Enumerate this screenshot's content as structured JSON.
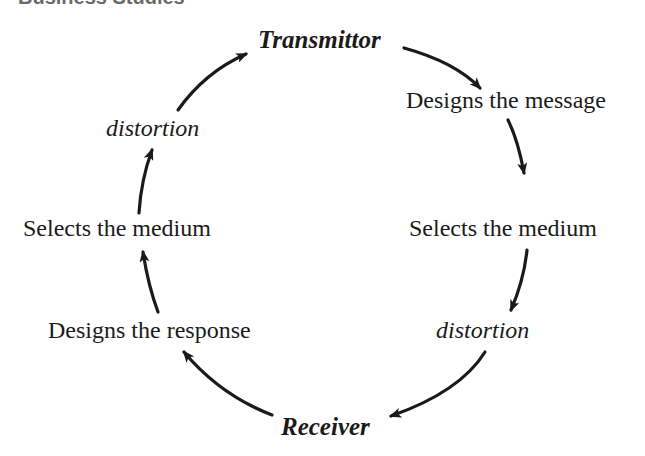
{
  "header": {
    "text": "Business Studies"
  },
  "diagram": {
    "type": "communication-cycle",
    "nodes": {
      "top": "Transmittor",
      "right_1": "Designs the message",
      "right_2": "Selects the medium",
      "right_3": "distortion",
      "bottom": "Receiver",
      "left_1": "Designs the response",
      "left_2": "Selects the medium",
      "left_3": "distortion"
    },
    "flow": [
      "Transmittor",
      "Designs the message",
      "Selects the medium",
      "distortion",
      "Receiver",
      "Designs the response",
      "Selects the medium",
      "distortion",
      "Transmittor"
    ],
    "arrow_color": "#1a1a1a"
  }
}
